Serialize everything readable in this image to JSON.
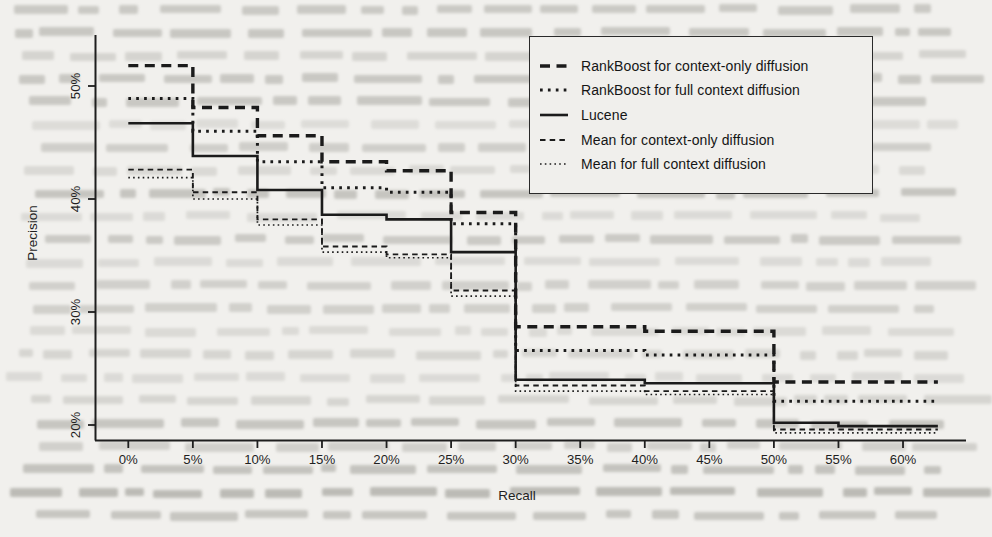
{
  "chart_data": {
    "type": "line",
    "subtype": "step",
    "title": "",
    "xlabel": "Recall",
    "ylabel": "Precision",
    "x_ticks": [
      {
        "label": "0%",
        "value": 0
      },
      {
        "label": "5%",
        "value": 5
      },
      {
        "label": "10%",
        "value": 10
      },
      {
        "label": "15%",
        "value": 15
      },
      {
        "label": "20%",
        "value": 20
      },
      {
        "label": "25%",
        "value": 25
      },
      {
        "label": "30%",
        "value": 30
      },
      {
        "label": "35%",
        "value": 35
      },
      {
        "label": "40%",
        "value": 40
      },
      {
        "label": "45%",
        "value": 45
      },
      {
        "label": "50%",
        "value": 50
      },
      {
        "label": "55%",
        "value": 55
      },
      {
        "label": "60%",
        "value": 60
      }
    ],
    "y_ticks": [
      {
        "label": "20%",
        "value": 20
      },
      {
        "label": "30%",
        "value": 30
      },
      {
        "label": "40%",
        "value": 40
      },
      {
        "label": "50%",
        "value": 50
      }
    ],
    "xlim": [
      -2.6,
      65
    ],
    "ylim": [
      18.7,
      54.5
    ],
    "grid": false,
    "legend_position": "top-right",
    "ink_color": "#1b1b1b",
    "paper_color": "#f1f0ed",
    "series": [
      {
        "name": "RankBoost for context-only diffusion",
        "style": "bold-dashed",
        "breaks": [
          0,
          5,
          10,
          15,
          20,
          25,
          30,
          40,
          50,
          62.7
        ],
        "levels": [
          51.8,
          48.1,
          45.6,
          43.3,
          42.5,
          38.8,
          28.7,
          28.3,
          23.8
        ]
      },
      {
        "name": "RankBoost for full context diffusion",
        "style": "bold-dotted",
        "breaks": [
          0,
          5,
          10,
          15,
          20,
          25,
          30,
          40,
          50,
          62.7
        ],
        "levels": [
          48.9,
          46.0,
          43.3,
          41.0,
          40.6,
          37.8,
          26.6,
          26.2,
          22.1
        ]
      },
      {
        "name": "Lucene",
        "style": "solid",
        "breaks": [
          0,
          5,
          10,
          15,
          20,
          25,
          30,
          40,
          50,
          55,
          62.7
        ],
        "levels": [
          46.7,
          43.8,
          40.8,
          38.6,
          38.2,
          35.3,
          24.0,
          23.7,
          20.2,
          19.9
        ]
      },
      {
        "name": "Mean for context-only diffusion",
        "style": "thin-dashed",
        "breaks": [
          0,
          5,
          10,
          15,
          20,
          25,
          30,
          40,
          50,
          62.7
        ],
        "levels": [
          42.6,
          40.6,
          38.2,
          35.8,
          35.1,
          31.9,
          23.5,
          23.0,
          19.6
        ]
      },
      {
        "name": "Mean for full context diffusion",
        "style": "fine-dotted",
        "breaks": [
          0,
          5,
          10,
          15,
          20,
          25,
          30,
          40,
          50,
          62.7
        ],
        "levels": [
          41.9,
          40.0,
          37.7,
          35.3,
          34.8,
          31.4,
          23.0,
          22.7,
          19.3
        ]
      }
    ]
  }
}
